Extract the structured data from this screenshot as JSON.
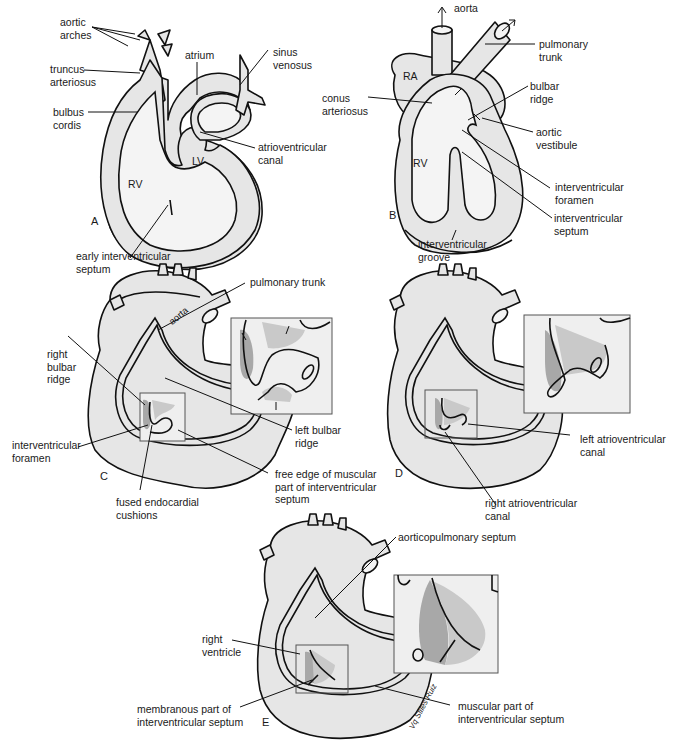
{
  "figure": {
    "colors": {
      "tissue": "#e6e6e6",
      "outline": "#111111",
      "shade_dark": "#a8a8a8",
      "shade_light": "#c9c9c9",
      "background": "#ffffff"
    }
  },
  "panels": {
    "A": {
      "letter": "A",
      "labels": {
        "aortic_arches": "aortic\narches",
        "truncus_arteriosus": "truncus\narteriosus",
        "bulbus_cordis": "bulbus\ncordis",
        "atrium": "atrium",
        "sinus_venosus": "sinus\nvenosus",
        "lv": "LV",
        "rv": "RV",
        "atrioventricular_canal": "atrioventricular\ncanal",
        "early_interventricular_septum": "early interventricular\nseptum"
      }
    },
    "B": {
      "letter": "B",
      "labels": {
        "aorta": "aorta",
        "pulmonary_trunk": "pulmonary\ntrunk",
        "ra": "RA",
        "conus_arteriosus": "conus\narteriosus",
        "bulbar_ridge": "bulbar\nridge",
        "aortic_vestibule": "aortic\nvestibule",
        "rv": "RV",
        "interventricular_foramen": "interventricular\nforamen",
        "interventricular_septum": "interventricular\nseptum",
        "interventricular_groove": "interventricular\ngroove"
      }
    },
    "C": {
      "letter": "C",
      "labels": {
        "aorta": "aorta",
        "pulmonary_trunk": "pulmonary trunk",
        "right_bulbar_ridge": "right\nbulbar\nridge",
        "interventricular_foramen": "interventricular\nforamen",
        "left_bulbar_ridge": "left bulbar\nridge",
        "free_edge": "free edge of muscular\npart of interventricular\nseptum",
        "fused_endocardial_cushions": "fused endocardial\ncushions"
      }
    },
    "D": {
      "letter": "D",
      "labels": {
        "left_av_canal": "left atrioventricular\ncanal",
        "right_av_canal": "right atrioventricular\ncanal"
      }
    },
    "E": {
      "letter": "E",
      "labels": {
        "aorticopulmonary_septum": "aorticopulmonary septum",
        "right_ventricle": "right\nventricle",
        "membranous_part": "membranous part of\ninterventricular septum",
        "muscular_part": "muscular part of\ninterventricular septum"
      },
      "signature": "Vq Stiles Ruiz"
    }
  }
}
